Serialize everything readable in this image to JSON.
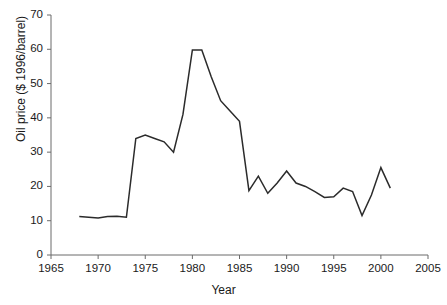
{
  "chart_data": {
    "type": "line",
    "title": "",
    "subtitle": "",
    "xlabel": "Year",
    "ylabel": "Oil price ($ 1996/barrel)",
    "xlim": [
      1965,
      2005
    ],
    "ylim": [
      0,
      70
    ],
    "xticks": [
      1965,
      1970,
      1975,
      1980,
      1985,
      1990,
      1995,
      2000,
      2005
    ],
    "xtick_labels": [
      "1965",
      "1970",
      "1975",
      "1980",
      "1985",
      "1990",
      "1995",
      "2000",
      "2005"
    ],
    "yticks": [
      0,
      10,
      20,
      30,
      40,
      50,
      60,
      70
    ],
    "ytick_labels": [
      "0",
      "10",
      "20",
      "30",
      "40",
      "50",
      "60",
      "70"
    ],
    "grid": false,
    "legend": null,
    "legend_position": "none",
    "line_color": "#2b2b2b",
    "line_width": 1.5,
    "markers": false,
    "annotations": [],
    "series": [
      {
        "name": "Oil price",
        "x": [
          1968,
          1969,
          1970,
          1971,
          1972,
          1973,
          1974,
          1975,
          1976,
          1977,
          1978,
          1979,
          1980,
          1981,
          1982,
          1983,
          1984,
          1985,
          1986,
          1987,
          1988,
          1989,
          1990,
          1991,
          1992,
          1993,
          1994,
          1995,
          1996,
          1997,
          1998,
          1999,
          2000,
          2001
        ],
        "y": [
          11.2,
          11.0,
          10.8,
          11.2,
          11.3,
          11.0,
          34.0,
          35.0,
          34.0,
          33.0,
          30.0,
          41.0,
          59.8,
          59.8,
          52.0,
          45.0,
          42.0,
          39.0,
          18.8,
          23.0,
          18.0,
          21.0,
          24.5,
          21.0,
          20.0,
          18.5,
          16.8,
          17.0,
          19.5,
          18.5,
          11.5,
          17.5,
          25.5,
          19.5
        ]
      }
    ]
  }
}
